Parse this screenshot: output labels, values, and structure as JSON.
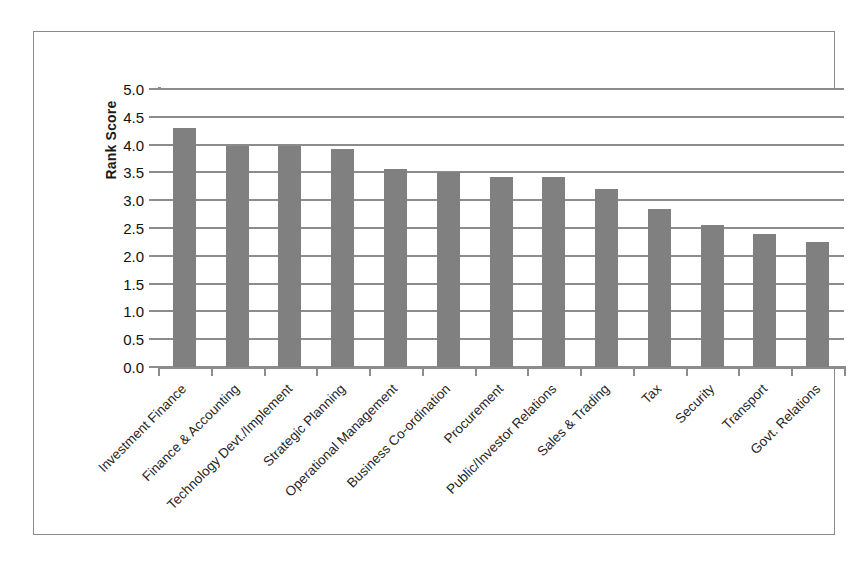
{
  "chart_data": {
    "type": "bar",
    "title": "",
    "xlabel": "",
    "ylabel": "Rank Score",
    "ylim": [
      0,
      5
    ],
    "ytick_step": 0.5,
    "grid": true,
    "legend": false,
    "bar_color": "#808080",
    "categories": [
      "Investment Finance",
      "Finance & Accounting",
      "Technology Devt./Implement",
      "Strategic Planning",
      "Operational Management",
      "Business Co-ordination",
      "Procurement",
      "Public/Investor Relations",
      "Sales & Trading",
      "Tax",
      "Security",
      "Transport",
      "Govt. Relations"
    ],
    "values": [
      4.3,
      3.97,
      3.97,
      3.92,
      3.57,
      3.5,
      3.42,
      3.42,
      3.2,
      2.85,
      2.55,
      2.4,
      2.25
    ],
    "ytick_labels": [
      "5.0",
      "4.5",
      "4.0",
      "3.5",
      "3.0",
      "2.5",
      "2.0",
      "1.5",
      "1.0",
      "0.5",
      "0.0"
    ],
    "ytick_values": [
      5.0,
      4.5,
      4.0,
      3.5,
      3.0,
      2.5,
      2.0,
      1.5,
      1.0,
      0.5,
      0.0
    ]
  },
  "axis": {
    "y_title": "Rank Score"
  }
}
